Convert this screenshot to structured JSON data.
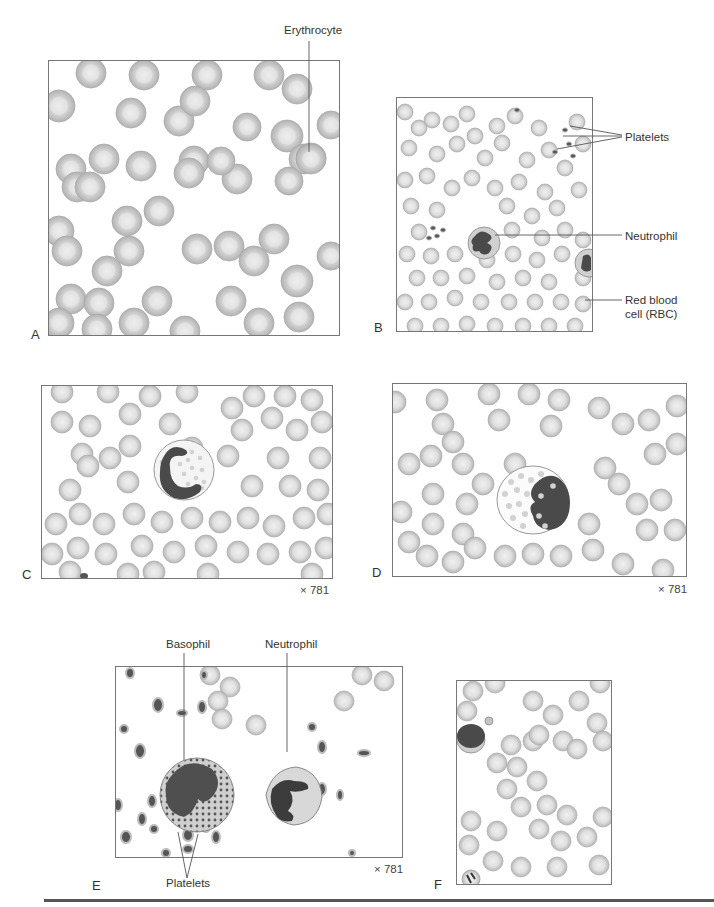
{
  "figure": {
    "panels": [
      {
        "id": "A",
        "letter": "A"
      },
      {
        "id": "B",
        "letter": "B"
      },
      {
        "id": "C",
        "letter": "C",
        "magnification": "× 781"
      },
      {
        "id": "D",
        "letter": "D",
        "magnification": "× 781"
      },
      {
        "id": "E",
        "letter": "E",
        "magnification": "× 781"
      },
      {
        "id": "F",
        "letter": "F"
      }
    ],
    "labels": {
      "erythrocyte": "Erythrocyte",
      "platelets_b": "Platelets",
      "neutrophil_b": "Neutrophil",
      "rbc_line1": "Red blood",
      "rbc_line2": "cell (RBC)",
      "basophil_e": "Basophil",
      "neutrophil_e": "Neutrophil",
      "platelets_e": "Platelets"
    },
    "colors": {
      "rbc_rim": "#b8b8b8",
      "rbc_center": "#e6e6e6",
      "nucleus": "#4a4a4a",
      "cytoplasm": "#d4d4d4",
      "frame": "#777777"
    }
  }
}
